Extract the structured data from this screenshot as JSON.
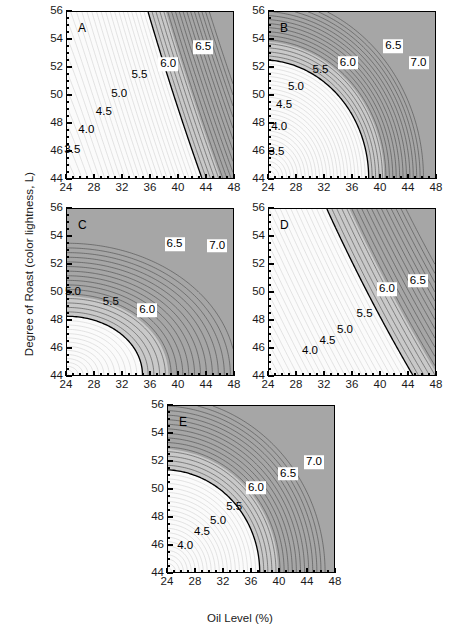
{
  "figure": {
    "xlabel": "Oil Level (%)",
    "ylabel": "Degree of Roast (color lightness, L)",
    "xticks": [
      "24",
      "28",
      "32",
      "36",
      "40",
      "44",
      "48"
    ],
    "yticks": [
      "44",
      "46",
      "48",
      "50",
      "52",
      "54",
      "56"
    ],
    "colors": {
      "light": "#fbfbfb",
      "mid": "#c9c9c9",
      "dark": "#a6a6a6",
      "line": "#555555",
      "axis": "#000000"
    }
  },
  "chart_data": {
    "type": "contour",
    "title": "",
    "xlabel": "Oil Level (%)",
    "ylabel": "Degree of Roast (color lightness, L)",
    "xlim": [
      24,
      48
    ],
    "ylim": [
      44,
      56
    ],
    "xticks": [
      24,
      28,
      32,
      36,
      40,
      44,
      48
    ],
    "yticks": [
      44,
      46,
      48,
      50,
      52,
      54,
      56
    ],
    "grid": false,
    "legend": "none",
    "panels": [
      {
        "letter": "A",
        "contour_labels": [
          {
            "value": "3.5",
            "x": 24.9,
            "y": 46.1,
            "boxed": false
          },
          {
            "value": "4.0",
            "x": 26.9,
            "y": 47.5,
            "boxed": false
          },
          {
            "value": "4.5",
            "x": 29.4,
            "y": 48.8,
            "boxed": false
          },
          {
            "value": "5.0",
            "x": 31.6,
            "y": 50.1,
            "boxed": false
          },
          {
            "value": "5.5",
            "x": 34.5,
            "y": 51.4,
            "boxed": false
          },
          {
            "value": "6.0",
            "x": 38.6,
            "y": 52.2,
            "boxed": true
          },
          {
            "value": "6.5",
            "x": 43.6,
            "y": 53.4,
            "boxed": true
          }
        ]
      },
      {
        "letter": "B",
        "contour_labels": [
          {
            "value": "3.5",
            "x": 25.2,
            "y": 45.9,
            "boxed": false
          },
          {
            "value": "4.0",
            "x": 25.6,
            "y": 47.7,
            "boxed": false
          },
          {
            "value": "4.5",
            "x": 26.3,
            "y": 49.3,
            "boxed": false
          },
          {
            "value": "5.0",
            "x": 28.0,
            "y": 50.6,
            "boxed": false
          },
          {
            "value": "5.5",
            "x": 31.5,
            "y": 51.8,
            "boxed": false
          },
          {
            "value": "6.0",
            "x": 35.4,
            "y": 52.3,
            "boxed": true
          },
          {
            "value": "6.5",
            "x": 41.9,
            "y": 53.5,
            "boxed": true
          },
          {
            "value": "7.0",
            "x": 45.5,
            "y": 52.3,
            "boxed": true
          }
        ]
      },
      {
        "letter": "C",
        "contour_labels": [
          {
            "value": "5.0",
            "x": 25.0,
            "y": 50.0,
            "boxed": false
          },
          {
            "value": "5.5",
            "x": 30.4,
            "y": 49.3,
            "boxed": false
          },
          {
            "value": "6.0",
            "x": 35.6,
            "y": 48.7,
            "boxed": true
          },
          {
            "value": "6.5",
            "x": 39.5,
            "y": 53.4,
            "boxed": true
          },
          {
            "value": "7.0",
            "x": 45.6,
            "y": 53.3,
            "boxed": true
          }
        ]
      },
      {
        "letter": "D",
        "contour_labels": [
          {
            "value": "4.0",
            "x": 30.0,
            "y": 45.8,
            "boxed": false
          },
          {
            "value": "4.5",
            "x": 32.5,
            "y": 46.5,
            "boxed": false
          },
          {
            "value": "5.0",
            "x": 35.0,
            "y": 47.3,
            "boxed": false
          },
          {
            "value": "5.5",
            "x": 37.8,
            "y": 48.4,
            "boxed": false
          },
          {
            "value": "6.0",
            "x": 41.0,
            "y": 50.2,
            "boxed": true
          },
          {
            "value": "6.5",
            "x": 45.4,
            "y": 50.8,
            "boxed": true
          }
        ]
      },
      {
        "letter": "E",
        "contour_labels": [
          {
            "value": "4.0",
            "x": 26.6,
            "y": 45.9,
            "boxed": false
          },
          {
            "value": "4.5",
            "x": 29.0,
            "y": 46.9,
            "boxed": false
          },
          {
            "value": "5.0",
            "x": 31.3,
            "y": 47.7,
            "boxed": false
          },
          {
            "value": "5.5",
            "x": 33.6,
            "y": 48.7,
            "boxed": false
          },
          {
            "value": "6.0",
            "x": 36.7,
            "y": 50.1,
            "boxed": true
          },
          {
            "value": "6.5",
            "x": 41.3,
            "y": 51.1,
            "boxed": true
          },
          {
            "value": "7.0",
            "x": 45.0,
            "y": 51.9,
            "boxed": true
          }
        ]
      }
    ]
  }
}
